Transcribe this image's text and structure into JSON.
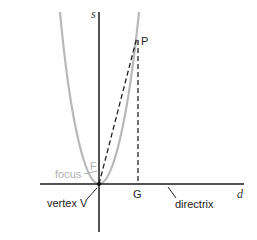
{
  "diagram": {
    "labels": {
      "vertical_axis": "s",
      "horizontal_axis": "d",
      "point_p": "P",
      "point_g": "G",
      "focus_point": "F",
      "focus_text": "focus",
      "vertex_text": "vertex V",
      "directrix_text": "directrix"
    },
    "colors": {
      "axis": "#1a1a1a",
      "parabola": "#b8b8b8",
      "dashed": "#222222",
      "focus_label": "#b0b0b0"
    }
  }
}
